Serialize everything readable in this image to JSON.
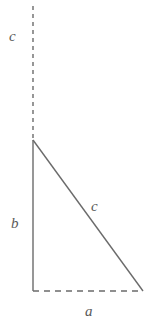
{
  "figure": {
    "type": "geometric-diagram",
    "background_color": "#ffffff",
    "stroke_color": "#6b6b6b",
    "label_color": "#595959",
    "canvas": {
      "width": 151,
      "height": 327
    },
    "vertices": {
      "apex": {
        "x": 33,
        "y": 140
      },
      "bottom_left": {
        "x": 33,
        "y": 291
      },
      "bottom_right": {
        "x": 143,
        "y": 291
      },
      "extension_top": {
        "x": 33,
        "y": 6
      }
    },
    "segments": [
      {
        "name": "vertical-extension",
        "style": "dashed",
        "x1": 33,
        "y1": 6,
        "x2": 33,
        "y2": 140,
        "dash": "4 4",
        "width": 1.4
      },
      {
        "name": "leg-b",
        "style": "solid",
        "x1": 33,
        "y1": 140,
        "x2": 33,
        "y2": 291,
        "width": 1.4
      },
      {
        "name": "base-a",
        "style": "dashed",
        "x1": 33,
        "y1": 291,
        "x2": 143,
        "y2": 291,
        "dash": "6 5",
        "width": 1.4
      },
      {
        "name": "hypotenuse-c",
        "style": "solid",
        "x1": 33,
        "y1": 140,
        "x2": 143,
        "y2": 291,
        "width": 1.4
      }
    ],
    "labels": {
      "c_top": "c",
      "b": "b",
      "c_hypotenuse": "c",
      "a": "a"
    }
  }
}
